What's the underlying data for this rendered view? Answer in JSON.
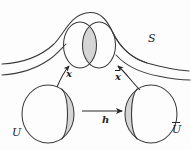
{
  "figure": {
    "kind": "mathematical-diagram",
    "background_color": "#fdfdfd",
    "stroke_color": "#3a3a3e",
    "shade_color": "#d5d5d5",
    "labels": {
      "surface": "S",
      "point_left": "x",
      "point_right": "x̄",
      "transition_map": "h",
      "chart_left": "U",
      "chart_right": "Ū"
    },
    "label_plain": {
      "surface": "S",
      "point_left": "x",
      "point_right": "x",
      "point_right_accent": "overbar",
      "transition_map": "h",
      "chart_left": "U",
      "chart_right": "U",
      "chart_right_accent": "overbar"
    },
    "elements": [
      {
        "name": "surface-curve",
        "type": "open-curve",
        "role": "surface S silhouette"
      },
      {
        "name": "patch-ellipse-left",
        "type": "ellipse",
        "role": "image of U on S"
      },
      {
        "name": "patch-ellipse-right",
        "type": "ellipse",
        "role": "image of U-bar on S"
      },
      {
        "name": "patch-overlap-lens",
        "type": "lens",
        "role": "overlap region",
        "shaded": true
      },
      {
        "name": "chart-ellipse-left",
        "type": "ellipse",
        "role": "chart domain U"
      },
      {
        "name": "chart-lune-left",
        "type": "lune",
        "role": "overlap preimage in U",
        "shaded": true
      },
      {
        "name": "chart-ellipse-right",
        "type": "ellipse",
        "role": "chart domain U-bar"
      },
      {
        "name": "chart-lune-right",
        "type": "lune",
        "role": "overlap preimage in U-bar",
        "shaded": true
      },
      {
        "name": "arrow-left-up",
        "type": "curved-arrow",
        "role": "parametrization from U to S"
      },
      {
        "name": "arrow-right-up",
        "type": "curved-arrow",
        "role": "parametrization from U-bar to S"
      },
      {
        "name": "arrow-transition",
        "type": "straight-arrow",
        "role": "transition map h from U to U-bar"
      }
    ]
  }
}
